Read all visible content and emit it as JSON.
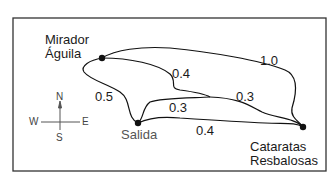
{
  "map": {
    "locations": [
      {
        "id": "mirador",
        "line1": "Mirador",
        "line2": "Águila"
      },
      {
        "id": "salida",
        "line1": "Salida"
      },
      {
        "id": "cataratas",
        "line1": "Cataratas",
        "line2": "Resbalosas"
      }
    ],
    "distances": {
      "mirador_salida": "0.5",
      "mirador_junction": "0.4",
      "mirador_cataratas": "1.0",
      "salida_junction": "0.3",
      "junction_cataratas": "0.3",
      "salida_cataratas": "0.4"
    },
    "compass": {
      "n": "N",
      "s": "S",
      "e": "E",
      "w": "W"
    },
    "colors": {
      "line": "#111111",
      "border": "#333333",
      "compass": "#555555"
    }
  }
}
